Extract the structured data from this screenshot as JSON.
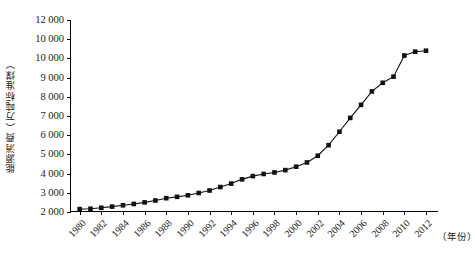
{
  "chart_data": {
    "type": "line",
    "title": "",
    "xlabel": "（年份）",
    "ylabel": "能源消费（万吨标准煤）",
    "xlim": [
      1979.2,
      2013.2
    ],
    "ylim": [
      2000,
      12000
    ],
    "ytick_step": 1000,
    "grid": false,
    "legend": null,
    "marker": "square",
    "series_color": "#111111",
    "ytick_labels": [
      "12 000",
      "10 000",
      "10 000",
      "9 000",
      "8 000",
      "7 000",
      "6 000",
      "5 000",
      "4 000",
      "3 000",
      "2 000"
    ],
    "ytick_values": [
      12000,
      11000,
      10000,
      9000,
      8000,
      7000,
      6000,
      5000,
      4000,
      3000,
      2000
    ],
    "xtick_labels": [
      "1980",
      "1982",
      "1984",
      "1986",
      "1988",
      "1990",
      "1992",
      "1994",
      "1996",
      "1998",
      "2000",
      "2002",
      "2004",
      "2006",
      "2008",
      "2010",
      "2012"
    ],
    "xtick_values": [
      1980,
      1982,
      1984,
      1986,
      1988,
      1990,
      1992,
      1994,
      1996,
      1998,
      2000,
      2002,
      2004,
      2006,
      2008,
      2010,
      2012
    ],
    "x": [
      1980,
      1981,
      1982,
      1983,
      1984,
      1985,
      1986,
      1987,
      1988,
      1989,
      1990,
      1991,
      1992,
      1993,
      1994,
      1995,
      1996,
      1997,
      1998,
      1999,
      2000,
      2001,
      2002,
      2003,
      2004,
      2005,
      2006,
      2007,
      2008,
      2009,
      2010,
      2011,
      2012
    ],
    "values": [
      2150,
      2170,
      2220,
      2280,
      2350,
      2420,
      2500,
      2600,
      2720,
      2790,
      2870,
      2990,
      3120,
      3300,
      3480,
      3700,
      3870,
      3980,
      4060,
      4180,
      4360,
      4580,
      4930,
      5480,
      6180,
      6900,
      7580,
      8280,
      8730,
      9050,
      10150,
      10350,
      10400
    ]
  }
}
